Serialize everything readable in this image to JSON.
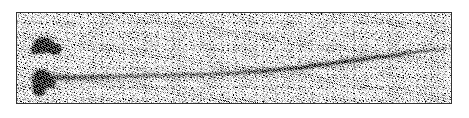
{
  "figure": {
    "kind": "scanned-photograph",
    "caption": "",
    "plate": {
      "x": 16,
      "y": 12,
      "width": 436,
      "height": 92,
      "border_color": "#4a4a4a",
      "background_color": "#e9e9e9",
      "page_background": "#ffffff"
    },
    "tone": {
      "ink": "#111111",
      "paper": "#ffffff",
      "midtone": "#9a9a9a",
      "grain": "high-contrast-dithered-halftone"
    }
  },
  "chart_data": {
    "type": "scatter",
    "title": "",
    "xlabel": "",
    "ylabel": "",
    "grid": false,
    "legend": null,
    "xlim": [
      0,
      436
    ],
    "ylim": [
      0,
      92
    ],
    "annotations": [
      {
        "name": "dark-blob-upper",
        "role": "dense-grain-cluster",
        "cx": 33,
        "cy": 34,
        "rx": 19,
        "ry": 13,
        "darkness": 0.95
      },
      {
        "name": "dark-blob-lower",
        "role": "dense-grain-cluster",
        "cx": 28,
        "cy": 69,
        "rx": 18,
        "ry": 16,
        "darkness": 0.96
      }
    ],
    "series": [
      {
        "name": "primary-track",
        "role": "particle-track-trail",
        "x": [
          30,
          60,
          95,
          130,
          165,
          200,
          235,
          270,
          300,
          330,
          360,
          390,
          415,
          434
        ],
        "y": [
          66,
          66,
          65,
          64,
          63,
          62,
          60,
          57,
          53,
          49,
          45,
          41,
          38,
          36
        ],
        "thickness": [
          9,
          8,
          7,
          6.5,
          6,
          5.5,
          5,
          4.5,
          4,
          3.5,
          3,
          2.6,
          2.2,
          2
        ],
        "opacity": [
          0.85,
          0.72,
          0.6,
          0.52,
          0.48,
          0.5,
          0.58,
          0.7,
          0.8,
          0.78,
          0.68,
          0.55,
          0.42,
          0.3
        ]
      }
    ]
  }
}
